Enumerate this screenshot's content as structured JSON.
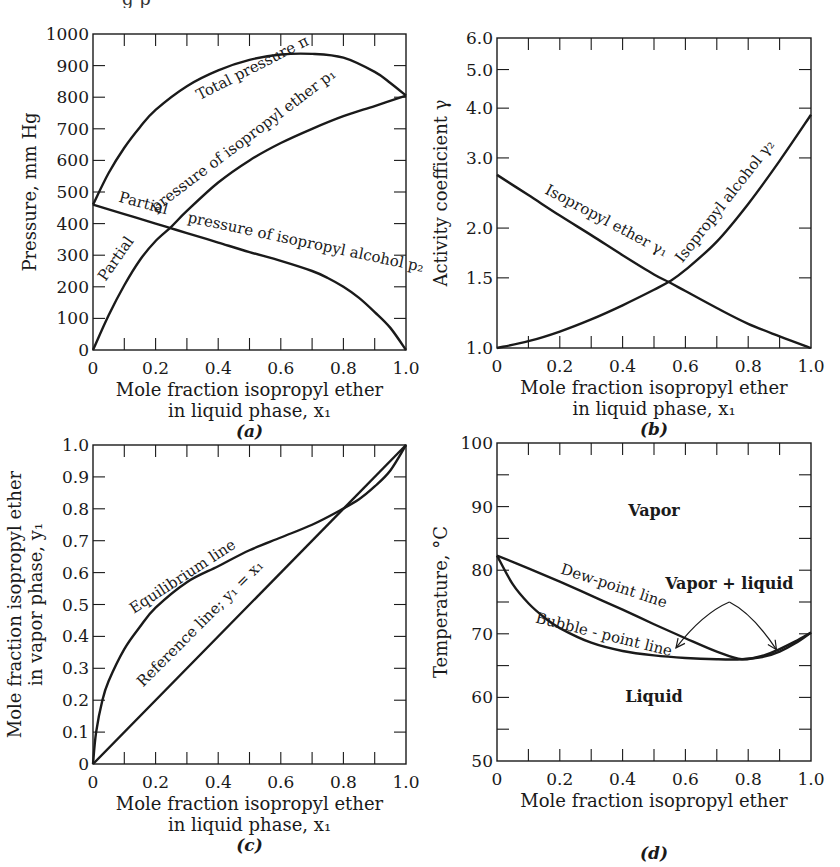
{
  "figure": {
    "clipped_header_fragments": [
      "g p",
      "·"
    ]
  },
  "chart_data": [
    {
      "id": "a",
      "panel_label": "(a)",
      "type": "line",
      "title": "",
      "xlabel": "Mole fraction isopropyl ether",
      "xlabel_line2": "in liquid phase, x₁",
      "ylabel": "Pressure, mm Hg",
      "xlim": [
        0,
        1.0
      ],
      "ylim": [
        0,
        1000
      ],
      "yscale": "linear",
      "xticks": [
        0,
        0.2,
        0.4,
        0.6,
        0.8,
        1.0
      ],
      "xtick_labels": [
        "0",
        "0.2",
        "0.4",
        "0.6",
        "0.8",
        "1.0"
      ],
      "xminor": [
        0.1,
        0.3,
        0.5,
        0.7,
        0.9
      ],
      "yticks": [
        0,
        100,
        200,
        300,
        400,
        500,
        600,
        700,
        800,
        900,
        1000
      ],
      "ytick_labels": [
        "0",
        "100",
        "200",
        "300",
        "400",
        "500",
        "600",
        "700",
        "800",
        "900",
        "1000"
      ],
      "grid": false,
      "frame": {
        "left": 93,
        "top": 34,
        "right": 406,
        "bottom": 350
      },
      "series": [
        {
          "name": "Total pressure π",
          "x": [
            0,
            0.05,
            0.1,
            0.15,
            0.2,
            0.3,
            0.4,
            0.5,
            0.6,
            0.7,
            0.8,
            0.9,
            0.95,
            1.0
          ],
          "y": [
            460,
            560,
            640,
            705,
            760,
            835,
            885,
            918,
            935,
            937,
            925,
            880,
            845,
            805
          ]
        },
        {
          "name": "Partial pressure of isopropyl ether p₁",
          "x": [
            0,
            0.05,
            0.1,
            0.15,
            0.2,
            0.25,
            0.3,
            0.4,
            0.5,
            0.6,
            0.7,
            0.8,
            0.9,
            1.0
          ],
          "y": [
            0,
            110,
            205,
            285,
            345,
            390,
            440,
            530,
            600,
            655,
            700,
            740,
            772,
            805
          ]
        },
        {
          "name": "Partial pressure of isopropyl alcohol p₂",
          "x": [
            0,
            0.1,
            0.2,
            0.25,
            0.3,
            0.4,
            0.5,
            0.6,
            0.7,
            0.75,
            0.8,
            0.85,
            0.9,
            0.95,
            1.0
          ],
          "y": [
            460,
            430,
            400,
            385,
            370,
            340,
            310,
            282,
            250,
            228,
            200,
            165,
            120,
            70,
            0
          ]
        }
      ],
      "annotations": [
        {
          "text": "Total pressure π",
          "x": 0.34,
          "y": 790,
          "rotate": -27
        },
        {
          "text": "Partial",
          "x": 0.08,
          "y": 470,
          "rotate": 15
        },
        {
          "text": "pressure of isopropyl ether p₁",
          "x": 0.2,
          "y": 435,
          "rotate": -37
        },
        {
          "text": "Partial",
          "x": 0.04,
          "y": 215,
          "rotate": -55
        },
        {
          "text": "pressure of isopropyl alcohol p₂",
          "x": 0.3,
          "y": 405,
          "rotate": 12
        }
      ]
    },
    {
      "id": "b",
      "panel_label": "(b)",
      "type": "line",
      "title": "",
      "xlabel": "Mole fraction isopropyl ether",
      "xlabel_line2": "in liquid phase, x₁",
      "ylabel": "Activity coefficient γ",
      "xlim": [
        0,
        1.0
      ],
      "ylim": [
        1.0,
        6.0
      ],
      "yscale": "log",
      "xticks": [
        0,
        0.2,
        0.4,
        0.6,
        0.8,
        1.0
      ],
      "xtick_labels": [
        "0",
        "0.2",
        "0.4",
        "0.6",
        "0.8",
        "1.0"
      ],
      "xminor": [
        0.1,
        0.3,
        0.5,
        0.7,
        0.9
      ],
      "yticks": [
        1.0,
        1.5,
        2.0,
        3.0,
        4.0,
        5.0,
        6.0
      ],
      "ytick_labels": [
        "1.0",
        "1.5",
        "2.0",
        "3.0",
        "4.0",
        "5.0",
        "6.0"
      ],
      "grid": false,
      "frame": {
        "left": 497,
        "top": 38,
        "right": 811,
        "bottom": 348
      },
      "series": [
        {
          "name": "Isopropyl ether γ₁",
          "x": [
            0,
            0.1,
            0.2,
            0.3,
            0.4,
            0.5,
            0.55,
            0.6,
            0.7,
            0.8,
            0.9,
            1.0
          ],
          "y": [
            2.72,
            2.42,
            2.15,
            1.92,
            1.71,
            1.53,
            1.46,
            1.39,
            1.26,
            1.15,
            1.07,
            1.0
          ]
        },
        {
          "name": "Isopropyl alcohol γ₂",
          "x": [
            0,
            0.1,
            0.2,
            0.3,
            0.4,
            0.5,
            0.55,
            0.6,
            0.7,
            0.8,
            0.9,
            1.0
          ],
          "y": [
            1.0,
            1.04,
            1.1,
            1.18,
            1.28,
            1.4,
            1.47,
            1.57,
            1.85,
            2.3,
            2.95,
            3.85
          ]
        }
      ],
      "annotations": [
        {
          "text": "Isopropyl ether γ₁",
          "x": 0.15,
          "y": 2.45,
          "rotate": 28
        },
        {
          "text": "Isopropyl alcohol γ₂",
          "x": 0.59,
          "y": 1.63,
          "rotate": -52
        }
      ]
    },
    {
      "id": "c",
      "panel_label": "(c)",
      "type": "line",
      "title": "",
      "xlabel": "Mole fraction isopropyl ether",
      "xlabel_line2": "in liquid phase, x₁",
      "ylabel": "Mole fraction isopropyl ether",
      "ylabel_line2": "in vapor phase, y₁",
      "xlim": [
        0,
        1.0
      ],
      "ylim": [
        0,
        1.0
      ],
      "yscale": "linear",
      "xticks": [
        0,
        0.2,
        0.4,
        0.6,
        0.8,
        1.0
      ],
      "xtick_labels": [
        "0",
        "0.2",
        "0.4",
        "0.6",
        "0.8",
        "1.0"
      ],
      "xminor": [
        0.1,
        0.3,
        0.5,
        0.7,
        0.9
      ],
      "yticks": [
        0,
        0.1,
        0.2,
        0.3,
        0.4,
        0.5,
        0.6,
        0.7,
        0.8,
        0.9,
        1.0
      ],
      "ytick_labels": [
        "0",
        "0.1",
        "0.2",
        "0.3",
        "0.4",
        "0.5",
        "0.6",
        "0.7",
        "0.8",
        "0.9",
        "1.0"
      ],
      "grid": false,
      "frame": {
        "left": 93,
        "top": 445,
        "right": 406,
        "bottom": 764
      },
      "series": [
        {
          "name": "Equilibrium line",
          "x": [
            0,
            0.01,
            0.03,
            0.05,
            0.1,
            0.15,
            0.2,
            0.3,
            0.4,
            0.5,
            0.6,
            0.7,
            0.78,
            0.85,
            0.9,
            0.95,
            1.0
          ],
          "y": [
            0,
            0.1,
            0.2,
            0.26,
            0.36,
            0.43,
            0.49,
            0.57,
            0.62,
            0.67,
            0.71,
            0.75,
            0.79,
            0.83,
            0.87,
            0.92,
            1.0
          ]
        },
        {
          "name": "Reference line; y₁ = x₁",
          "x": [
            0,
            1.0
          ],
          "y": [
            0,
            1.0
          ]
        }
      ],
      "annotations": [
        {
          "text": "Equilibrium line",
          "x": 0.13,
          "y": 0.47,
          "rotate": -33
        },
        {
          "text": "Reference line; y₁ = x₁",
          "x": 0.16,
          "y": 0.24,
          "rotate": -45
        }
      ]
    },
    {
      "id": "d",
      "panel_label": "(d)",
      "type": "line",
      "title": "",
      "xlabel": "Mole fraction isopropyl ether",
      "ylabel": "Temperature, °C",
      "xlim": [
        0,
        1.0
      ],
      "ylim": [
        50,
        100
      ],
      "yscale": "linear",
      "xticks": [
        0,
        0.2,
        0.4,
        0.6,
        0.8,
        1.0
      ],
      "xtick_labels": [
        "0",
        "0.2",
        "0.4",
        "0.6",
        "0.8",
        "1.0"
      ],
      "xminor": [
        0.1,
        0.3,
        0.5,
        0.7,
        0.9
      ],
      "yticks": [
        50,
        55,
        60,
        65,
        70,
        75,
        80,
        85,
        90,
        95,
        100
      ],
      "ytick_labels": [
        "50",
        "",
        "60",
        "",
        "70",
        "",
        "80",
        "",
        "90",
        "",
        "100"
      ],
      "grid": false,
      "frame": {
        "left": 497,
        "top": 443,
        "right": 811,
        "bottom": 761
      },
      "series": [
        {
          "name": "Dew-point line",
          "x": [
            0,
            0.1,
            0.2,
            0.3,
            0.4,
            0.5,
            0.6,
            0.7,
            0.78,
            0.85,
            0.9,
            0.95,
            1.0
          ],
          "y": [
            82.3,
            80.3,
            78.2,
            76.0,
            73.8,
            71.5,
            69.3,
            67.2,
            66.0,
            66.6,
            67.6,
            68.8,
            70.2
          ]
        },
        {
          "name": "Bubble-point line",
          "x": [
            0,
            0.05,
            0.1,
            0.15,
            0.2,
            0.3,
            0.4,
            0.5,
            0.6,
            0.7,
            0.78,
            0.85,
            0.9,
            0.95,
            1.0
          ],
          "y": [
            82.3,
            77.8,
            74.8,
            72.6,
            70.9,
            68.6,
            67.3,
            66.6,
            66.2,
            66.0,
            66.0,
            66.4,
            67.2,
            68.5,
            70.2
          ]
        }
      ],
      "annotations": [
        {
          "text": "Vapor",
          "x": 0.5,
          "y": 88.5,
          "rotate": 0,
          "bold": true
        },
        {
          "text": "Liquid",
          "x": 0.5,
          "y": 59.3,
          "rotate": 0,
          "bold": true
        },
        {
          "text": "Vapor + liquid",
          "x": 0.74,
          "y": 77.0,
          "rotate": 0,
          "bold": true
        },
        {
          "text": "Dew-point line",
          "x": 0.2,
          "y": 79.5,
          "rotate": 18
        },
        {
          "text": "Bubble - point line",
          "x": 0.12,
          "y": 71.8,
          "rotate": 14
        }
      ],
      "arrows": [
        {
          "from": [
            0.74,
            75.0
          ],
          "to": [
            0.57,
            67.8
          ]
        },
        {
          "from": [
            0.74,
            75.0
          ],
          "to": [
            0.89,
            67.5
          ]
        }
      ]
    }
  ]
}
